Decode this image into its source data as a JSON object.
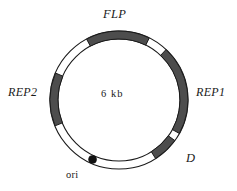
{
  "figure": {
    "kind": "circular-plasmid-map",
    "background_color": "#ffffff",
    "center_label": "6 kb"
  },
  "geometry": {
    "center_x": 119,
    "center_y": 100,
    "outer_radius": 69,
    "inner_radius": 61,
    "ring_thickness": 8
  },
  "colors": {
    "segment_fill": "#4d4d4d",
    "segment_stroke": "#1a1a1a",
    "ring_stroke": "#1a1a1a",
    "ring_fill": "#ffffff",
    "ori_marker": "#111111",
    "text": "#1a1a1a"
  },
  "segments": [
    {
      "id": "flp",
      "label": "FLP",
      "style": "italic",
      "filled": true,
      "start_angle": 118,
      "end_angle": 64,
      "label_x": 103,
      "label_y": 8,
      "font_size": "12.5px"
    },
    {
      "id": "rep1",
      "label": "REP1",
      "style": "italic",
      "filled": true,
      "start_angle": 47,
      "end_angle": -29,
      "label_x": 196,
      "label_y": 86,
      "font_size": "12px"
    },
    {
      "id": "d",
      "label": "D",
      "style": "italic",
      "filled": true,
      "start_angle": -36,
      "end_angle": -58,
      "label_x": 186,
      "label_y": 152,
      "font_size": "12.5px"
    },
    {
      "id": "rep2",
      "label": "REP2",
      "style": "italic",
      "filled": true,
      "start_angle": 202,
      "end_angle": 157,
      "label_x": 8,
      "label_y": 86,
      "font_size": "12px"
    }
  ],
  "markers": [
    {
      "id": "ori",
      "label": "ori",
      "style": "upright",
      "angle": -114,
      "radius": 4,
      "label_x": 66,
      "label_y": 170,
      "font_size": "10.5px"
    }
  ],
  "labels": {
    "flp": "FLP",
    "rep1": "REP1",
    "rep2": "REP2",
    "d": "D",
    "ori": "ori",
    "size": "6 kb"
  }
}
